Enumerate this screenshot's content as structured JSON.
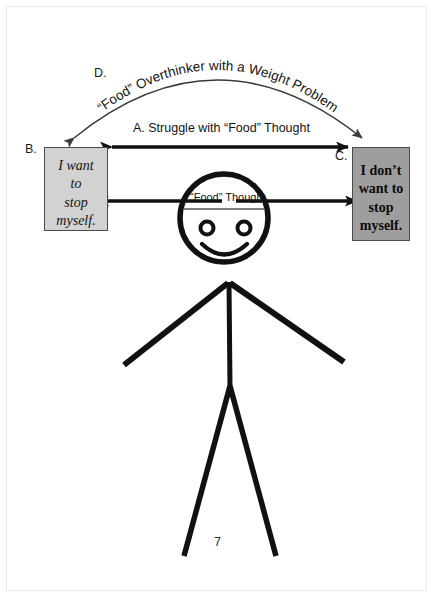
{
  "page": {
    "number": "7",
    "background": "#ffffff",
    "width": 435,
    "height": 599
  },
  "diagram": {
    "title_arc": "“Food” Overthinker with a Weight Problem",
    "center_label": "“Food” Thought",
    "labels": {
      "a": "A.  Struggle with “Food” Thought",
      "b": "B.",
      "c": "C.",
      "d": "D."
    },
    "boxes": {
      "left": {
        "tag": "B.",
        "fill": "#d2d2d2",
        "stroke": "#4a4a4a",
        "style": "italic",
        "lines": [
          "I want",
          "to",
          "stop",
          "myself."
        ]
      },
      "right": {
        "tag": "C.",
        "fill": "#9e9e9e",
        "stroke": "#4a4a4a",
        "style": "bold",
        "lines": [
          "I don’t",
          "want to",
          "stop",
          "myself."
        ]
      }
    },
    "figure": {
      "name": "stick-figure",
      "stroke": "#111111",
      "parts": [
        "head",
        "face-line",
        "left-eye",
        "right-eye",
        "smile",
        "torso",
        "left-arm",
        "right-arm",
        "left-leg",
        "right-leg"
      ]
    },
    "arrows": {
      "struggle": {
        "name": "arrow-a-struggle",
        "direction": "double",
        "stroke": "#111111"
      },
      "left_arm_arrow": {
        "name": "arrow-left-arm",
        "direction": "left",
        "stroke": "#111111"
      },
      "right_arm_arrow": {
        "name": "arrow-right-arm",
        "direction": "right",
        "stroke": "#111111"
      },
      "overarching": {
        "name": "arrow-d-arc",
        "direction": "double",
        "stroke": "#3a3a3a"
      }
    }
  }
}
